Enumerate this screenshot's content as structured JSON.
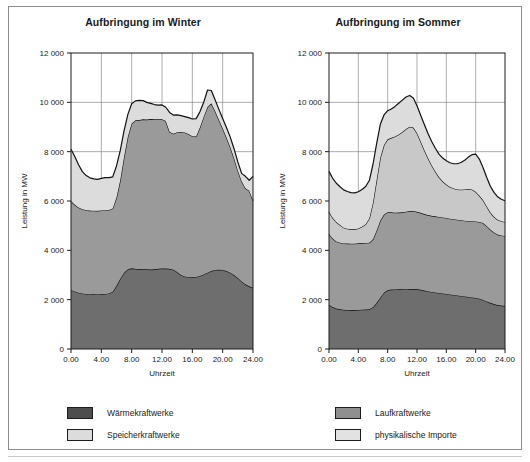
{
  "figure": {
    "background_color": "#ffffff",
    "border_color": "#8d8d8d"
  },
  "colors": {
    "waermekraftwerke": "#6e6e6e",
    "laufkraftwerke": "#9a9a9a",
    "physikalische_importe": "#c8c8c8",
    "speicherkraftwerke": "#dcdcdc",
    "outline": "#111111",
    "grid": "#8a8a8a",
    "axis": "#1c1c1c",
    "text": "#1a1a1a"
  },
  "legend": {
    "left": [
      {
        "label": "Wärmekraftwerke",
        "color": "#4e4e4e",
        "key": "waermekraftwerke"
      },
      {
        "label": "Speicherkraftwerke",
        "color": "#dcdcdc",
        "key": "speicherkraftwerke"
      }
    ],
    "right": [
      {
        "label": "Laufkraftwerke",
        "color": "#8f8f8f",
        "key": "laufkraftwerke"
      },
      {
        "label": "physikalische Importe",
        "color": "#e2e2e2",
        "key": "physikalische_importe"
      }
    ]
  },
  "chart_data": [
    {
      "type": "area",
      "stacked": true,
      "title": "Aufbringung im Winter",
      "xlabel": "Uhrzeit",
      "ylabel": "Leistung in MW",
      "xlim": [
        0,
        24
      ],
      "ylim": [
        0,
        12000
      ],
      "xticks": [
        0,
        4,
        8,
        12,
        16,
        20,
        24
      ],
      "xticklabels": [
        "0.00",
        "4.00",
        "8.00",
        "12.00",
        "16.00",
        "20.00",
        "24.00"
      ],
      "yticks": [
        0,
        2000,
        4000,
        6000,
        8000,
        10000,
        12000
      ],
      "yticklabels": [
        "0",
        "2 000",
        "4 000",
        "6 000",
        "8 000",
        "10 000",
        "12 000"
      ],
      "grid": true,
      "legend_position": "below-figure",
      "x": [
        0,
        0.5,
        1,
        1.5,
        2,
        2.5,
        3,
        3.5,
        4,
        4.5,
        5,
        5.5,
        6,
        6.5,
        7,
        7.5,
        8,
        8.5,
        9,
        9.5,
        10,
        10.5,
        11,
        11.5,
        12,
        12.5,
        13,
        13.5,
        14,
        14.5,
        15,
        15.5,
        16,
        16.5,
        17,
        17.5,
        18,
        18.5,
        19,
        19.5,
        20,
        20.5,
        21,
        21.5,
        22,
        22.5,
        23,
        23.5,
        24
      ],
      "series": [
        {
          "name": "Wärmekraftwerke",
          "color": "#6e6e6e",
          "values": [
            2380,
            2330,
            2280,
            2250,
            2230,
            2220,
            2215,
            2210,
            2215,
            2230,
            2250,
            2320,
            2560,
            2850,
            3090,
            3230,
            3270,
            3250,
            3240,
            3230,
            3230,
            3220,
            3230,
            3250,
            3265,
            3260,
            3250,
            3215,
            3120,
            3000,
            2940,
            2910,
            2905,
            2920,
            2960,
            3020,
            3090,
            3160,
            3205,
            3215,
            3205,
            3160,
            3090,
            3000,
            2880,
            2740,
            2620,
            2540,
            2480
          ]
        },
        {
          "name": "Laufkraftwerke",
          "color": "#9a9a9a",
          "values": [
            3620,
            3520,
            3460,
            3420,
            3400,
            3390,
            3390,
            3390,
            3400,
            3400,
            3390,
            3380,
            3580,
            4000,
            4700,
            5380,
            5870,
            6020,
            6040,
            6080,
            6070,
            6100,
            6080,
            6060,
            6050,
            5980,
            5560,
            5510,
            5670,
            5800,
            5840,
            5810,
            5720,
            5690,
            6020,
            6400,
            6720,
            6800,
            6440,
            6080,
            5740,
            5420,
            5100,
            4740,
            4360,
            4060,
            3900,
            3880,
            3540
          ]
        },
        {
          "name": "Speicherkraftwerke",
          "color": "#dcdcdc",
          "values": [
            2100,
            1950,
            1730,
            1520,
            1400,
            1330,
            1290,
            1280,
            1300,
            1320,
            1310,
            1280,
            1280,
            1200,
            1060,
            900,
            800,
            790,
            800,
            760,
            700,
            640,
            600,
            580,
            580,
            560,
            780,
            760,
            700,
            660,
            640,
            660,
            700,
            730,
            640,
            580,
            690,
            520,
            460,
            420,
            400,
            400,
            400,
            380,
            340,
            320,
            480,
            420,
            980
          ]
        }
      ],
      "total_hint": "Summe entspricht der oberen Kurve (max. ca. 10 500 MW um 18.00 Uhr)"
    },
    {
      "type": "area",
      "stacked": true,
      "title": "Aufbringung im Sommer",
      "xlabel": "Uhrzeit",
      "ylabel": "Leistung in MW",
      "xlim": [
        0,
        24
      ],
      "ylim": [
        0,
        12000
      ],
      "xticks": [
        0,
        4,
        8,
        12,
        16,
        20,
        24
      ],
      "xticklabels": [
        "0.00",
        "4.00",
        "8.00",
        "12.00",
        "16.00",
        "20.00",
        "24.00"
      ],
      "yticks": [
        0,
        2000,
        4000,
        6000,
        8000,
        10000,
        12000
      ],
      "yticklabels": [
        "0",
        "2 000",
        "4 000",
        "6 000",
        "8 000",
        "10 000",
        "12 000"
      ],
      "grid": true,
      "legend_position": "below-figure",
      "x": [
        0,
        0.5,
        1,
        1.5,
        2,
        2.5,
        3,
        3.5,
        4,
        4.5,
        5,
        5.5,
        6,
        6.5,
        7,
        7.5,
        8,
        8.5,
        9,
        9.5,
        10,
        10.5,
        11,
        11.5,
        12,
        12.5,
        13,
        13.5,
        14,
        14.5,
        15,
        15.5,
        16,
        16.5,
        17,
        17.5,
        18,
        18.5,
        19,
        19.5,
        20,
        20.5,
        21,
        21.5,
        22,
        22.5,
        23,
        23.5,
        24
      ],
      "series": [
        {
          "name": "Wärmekraftwerke",
          "color": "#6e6e6e",
          "values": [
            1790,
            1700,
            1640,
            1610,
            1590,
            1585,
            1580,
            1580,
            1585,
            1595,
            1600,
            1610,
            1690,
            1870,
            2080,
            2280,
            2390,
            2410,
            2415,
            2420,
            2420,
            2425,
            2430,
            2435,
            2430,
            2400,
            2370,
            2340,
            2310,
            2290,
            2270,
            2250,
            2230,
            2210,
            2190,
            2170,
            2150,
            2130,
            2110,
            2090,
            2070,
            2040,
            1990,
            1930,
            1870,
            1820,
            1780,
            1760,
            1750
          ]
        },
        {
          "name": "Laufkraftwerke",
          "color": "#9a9a9a",
          "values": [
            2870,
            2780,
            2720,
            2700,
            2690,
            2690,
            2690,
            2690,
            2700,
            2700,
            2700,
            2700,
            2760,
            2930,
            3130,
            3170,
            3150,
            3130,
            3110,
            3110,
            3120,
            3140,
            3160,
            3160,
            3130,
            3120,
            3100,
            3090,
            3090,
            3090,
            3080,
            3080,
            3080,
            3070,
            3070,
            3070,
            3070,
            3070,
            3080,
            3090,
            3100,
            3110,
            3120,
            3060,
            2970,
            2900,
            2860,
            2840,
            2830
          ]
        },
        {
          "name": "physikalische Importe",
          "color": "#c8c8c8",
          "values": [
            900,
            840,
            790,
            720,
            640,
            600,
            580,
            580,
            600,
            660,
            760,
            980,
            1480,
            2060,
            2550,
            2820,
            2960,
            3020,
            3090,
            3170,
            3260,
            3350,
            3420,
            3380,
            3200,
            2900,
            2600,
            2310,
            2050,
            1820,
            1620,
            1470,
            1360,
            1290,
            1250,
            1230,
            1240,
            1270,
            1300,
            1290,
            1200,
            1070,
            930,
            800,
            700,
            640,
            600,
            580,
            570
          ]
        },
        {
          "name": "Speicherkraftwerke",
          "color": "#dcdcdc",
          "values": [
            1640,
            1600,
            1570,
            1550,
            1530,
            1510,
            1490,
            1480,
            1490,
            1510,
            1530,
            1540,
            1560,
            1480,
            1350,
            1220,
            1160,
            1170,
            1220,
            1260,
            1290,
            1300,
            1270,
            1200,
            1100,
            1060,
            1030,
            1000,
            960,
            940,
            930,
            940,
            960,
            980,
            1000,
            1040,
            1100,
            1180,
            1290,
            1410,
            1530,
            1480,
            1320,
            1170,
            1060,
            990,
            930,
            890,
            860
          ]
        }
      ],
      "total_hint": "Summe entspricht der oberen Kurve (max. ca. 9 500 MW um 11.30 Uhr)"
    }
  ]
}
